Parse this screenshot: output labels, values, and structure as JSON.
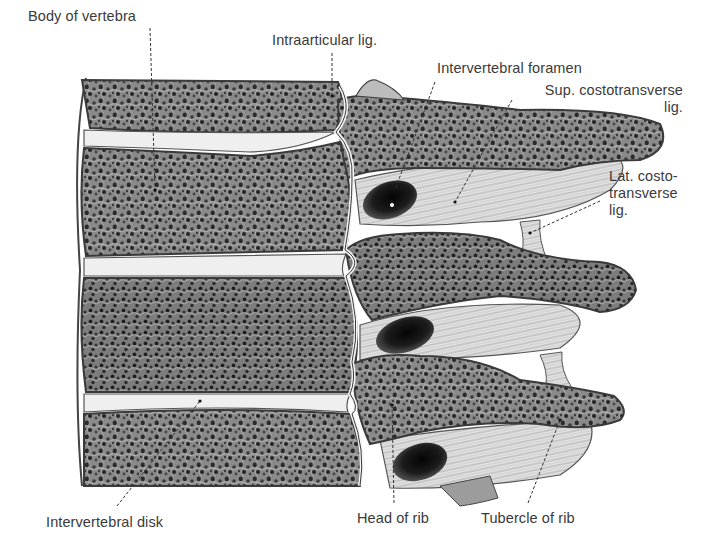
{
  "figure": {
    "background_color": "#ffffff",
    "bone_cortex_color": "#c9c9c9",
    "bone_cancellous_color": "#6e6e6e",
    "disk_color": "#efefef",
    "ligament_color": "#dcdcdc",
    "foramen_color": "#1a1a1a",
    "label_color": "#3a3a3a"
  },
  "labels": [
    {
      "id": "body-of-vertebra",
      "text": "Body of vertebra",
      "x": 28,
      "y": 8,
      "leader": {
        "x1": 150,
        "y1": 28,
        "x2": 155,
        "y2": 190
      }
    },
    {
      "id": "intraarticular-lig",
      "text": "Intraarticular lig.",
      "x": 272,
      "y": 32,
      "leader": {
        "x1": 332,
        "y1": 53,
        "x2": 332,
        "y2": 96
      }
    },
    {
      "id": "intervertebral-foramen",
      "text": "Intervertebral foramen",
      "x": 437,
      "y": 60,
      "leader": {
        "x1": 435,
        "y1": 82,
        "x2": 395,
        "y2": 190
      }
    },
    {
      "id": "sup-costotransverse-lig",
      "text": "Sup. costotransverse\nlig.",
      "x": 520,
      "y": 82,
      "align": "right",
      "leader": {
        "x1": 512,
        "y1": 100,
        "x2": 455,
        "y2": 202
      }
    },
    {
      "id": "lat-costotransverse-lig",
      "text": "Lat. costo-\ntransverse\nlig.",
      "x": 609,
      "y": 168,
      "leader": {
        "x1": 600,
        "y1": 201,
        "x2": 530,
        "y2": 233
      }
    },
    {
      "id": "intervertebral-disk",
      "text": "Intervertebral disk",
      "x": 46,
      "y": 514,
      "leader": {
        "x1": 117,
        "y1": 506,
        "x2": 200,
        "y2": 401
      }
    },
    {
      "id": "head-of-rib",
      "text": "Head of rib",
      "x": 357,
      "y": 510,
      "leader": {
        "x1": 394,
        "y1": 503,
        "x2": 392,
        "y2": 405
      }
    },
    {
      "id": "tubercle-of-rib",
      "text": "Tubercle of rib",
      "x": 481,
      "y": 510,
      "leader": {
        "x1": 528,
        "y1": 503,
        "x2": 560,
        "y2": 420
      }
    }
  ]
}
